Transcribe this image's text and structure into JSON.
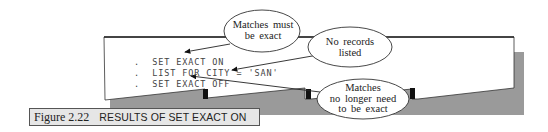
{
  "screen": {
    "prompt_char": ".",
    "commands": [
      "SET EXACT ON",
      "LIST FOR CITY = 'SAN'",
      "SET EXACT OFF"
    ]
  },
  "callouts": [
    {
      "lines": [
        "Matches must",
        "be exact"
      ],
      "points_to": "SET EXACT ON"
    },
    {
      "lines": [
        "No records",
        "listed"
      ],
      "points_to": "LIST FOR CITY = 'SAN'"
    },
    {
      "lines": [
        "Matches",
        "no longer need",
        "to be exact"
      ],
      "points_to": "SET EXACT OFF"
    }
  ],
  "caption": {
    "number": "Figure 2.22",
    "title": "RESULTS OF SET EXACT ON"
  },
  "colors": {
    "shadow": "#9a9a9a",
    "screen": "#ffffff",
    "caption_bg": "#e6e6e6",
    "ink": "#222222"
  }
}
